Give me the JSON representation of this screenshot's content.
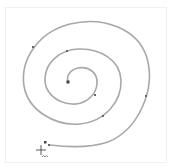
{
  "canvas": {
    "background": "#ffffff",
    "frame_color": "#f0f0f0"
  },
  "spiral": {
    "stroke_color": "#a8a8a8",
    "stroke_width": 1.6,
    "node_color": "#555555",
    "start_node": "square-anchor",
    "end_cursor": "pen-tool-cursor"
  },
  "cursor": {
    "icon": "crosshair-pen-cursor",
    "label": "~~"
  }
}
